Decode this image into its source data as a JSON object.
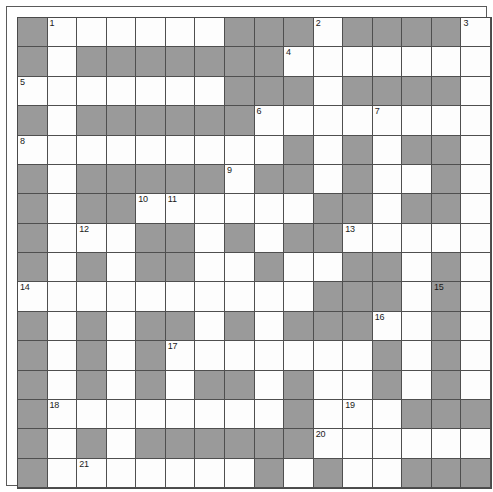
{
  "puzzle": {
    "title": "Crossword Grid",
    "type": "crossword",
    "rows": 16,
    "cols": 16,
    "colors": {
      "block": "#9a9a9a",
      "open": "#fdfdfd",
      "gridline": "#4f4f4f",
      "frame": "#5a5a5a",
      "number_text": "#1a1a1a"
    },
    "legend": {
      "open_label": "open-cell",
      "block_label": "blocked-cell"
    },
    "clue_numbers_visible": [
      1,
      2,
      3,
      4,
      5,
      6,
      7,
      8,
      9,
      10,
      11,
      12,
      13,
      14,
      15,
      16,
      17,
      18,
      19,
      20,
      21,
      22,
      23
    ],
    "numbers": {
      "1": {
        "row": 0,
        "col": 1
      },
      "2": {
        "row": 0,
        "col": 10
      },
      "3": {
        "row": 0,
        "col": 15
      },
      "4": {
        "row": 1,
        "col": 9
      },
      "5": {
        "row": 2,
        "col": 0
      },
      "6": {
        "row": 3,
        "col": 8
      },
      "7": {
        "row": 3,
        "col": 12
      },
      "8": {
        "row": 4,
        "col": 0
      },
      "9": {
        "row": 5,
        "col": 7
      },
      "10": {
        "row": 6,
        "col": 4
      },
      "11": {
        "row": 6,
        "col": 5
      },
      "12": {
        "row": 7,
        "col": 2
      },
      "13": {
        "row": 7,
        "col": 11
      },
      "14": {
        "row": 9,
        "col": 0
      },
      "15": {
        "row": 9,
        "col": 14
      },
      "16": {
        "row": 10,
        "col": 12
      },
      "17": {
        "row": 11,
        "col": 5
      },
      "18": {
        "row": 13,
        "col": 1
      },
      "19": {
        "row": 13,
        "col": 11
      },
      "20": {
        "row": 14,
        "col": 10
      },
      "21": {
        "row": 15,
        "col": 2
      },
      "22": {
        "row": 17,
        "col": 1
      },
      "23": {
        "row": 19,
        "col": 6
      }
    },
    "grid": [
      "#......###.####.",
      "#.#######.......",
      ".......###.####.",
      "#.######....#...",
      "................",
      "#.#####.##.##.#.",
      "#.##......##.##.",
      "#.#.###.#.##.##.",
      "..#.##..#..##.#.",
      "..........###.#.",
      "#.#.##.#.###..#.",
      "#.#.#.......#.#.",
      "#.#.##.##.#.##..",
      "#.........#..###",
      "#.#.#####.......",
      "#.#.......#.#.##",
      "#.#.#.#.#.#.#.#.",
      "#.............#.",
      "###.####.#..#.##",
      "###.##........##",
      "###.#########.##"
    ],
    "grid_rows": [
      {
        "index": 0,
        "cells": [
          "block",
          "open",
          "open",
          "open",
          "open",
          "open",
          "open",
          "block",
          "block",
          "block",
          "open",
          "block",
          "block",
          "block",
          "block",
          "open"
        ]
      },
      {
        "index": 1,
        "cells": [
          "block",
          "open",
          "block",
          "block",
          "block",
          "block",
          "block",
          "block",
          "block",
          "open",
          "open",
          "open",
          "open",
          "open",
          "open",
          "open"
        ]
      },
      {
        "index": 2,
        "cells": [
          "open",
          "open",
          "open",
          "open",
          "open",
          "open",
          "open",
          "block",
          "block",
          "block",
          "open",
          "block",
          "block",
          "block",
          "block",
          "open"
        ]
      },
      {
        "index": 3,
        "cells": [
          "block",
          "open",
          "block",
          "block",
          "block",
          "block",
          "block",
          "block",
          "open",
          "open",
          "open",
          "open",
          "open",
          "open",
          "open",
          "open"
        ]
      },
      {
        "index": 4,
        "cells": [
          "open",
          "open",
          "open",
          "open",
          "open",
          "open",
          "open",
          "open",
          "open",
          "block",
          "open",
          "block",
          "open",
          "block",
          "block",
          "open"
        ]
      },
      {
        "index": 5,
        "cells": [
          "block",
          "open",
          "block",
          "block",
          "block",
          "block",
          "block",
          "open",
          "block",
          "block",
          "open",
          "block",
          "open",
          "open",
          "block",
          "open"
        ]
      },
      {
        "index": 6,
        "cells": [
          "block",
          "open",
          "block",
          "block",
          "open",
          "open",
          "open",
          "open",
          "open",
          "open",
          "block",
          "block",
          "open",
          "block",
          "block",
          "open"
        ]
      },
      {
        "index": 7,
        "cells": [
          "block",
          "open",
          "open",
          "open",
          "block",
          "block",
          "open",
          "block",
          "open",
          "block",
          "block",
          "open",
          "open",
          "open",
          "open",
          "open"
        ]
      },
      {
        "index": 8,
        "cells": [
          "block",
          "open",
          "block",
          "open",
          "block",
          "block",
          "open",
          "open",
          "block",
          "open",
          "open",
          "block",
          "block",
          "open",
          "block",
          "open"
        ]
      },
      {
        "index": 9,
        "cells": [
          "open",
          "open",
          "open",
          "open",
          "open",
          "open",
          "open",
          "open",
          "open",
          "open",
          "block",
          "block",
          "block",
          "open",
          "block",
          "open"
        ]
      },
      {
        "index": 10,
        "cells": [
          "block",
          "open",
          "block",
          "open",
          "block",
          "block",
          "open",
          "block",
          "open",
          "block",
          "block",
          "block",
          "open",
          "open",
          "block",
          "open"
        ]
      },
      {
        "index": 11,
        "cells": [
          "block",
          "open",
          "block",
          "open",
          "block",
          "open",
          "open",
          "open",
          "open",
          "open",
          "open",
          "open",
          "block",
          "open",
          "block",
          "open"
        ]
      },
      {
        "index": 12,
        "cells": [
          "block",
          "open",
          "block",
          "open",
          "block",
          "open",
          "block",
          "block",
          "open",
          "block",
          "open",
          "open",
          "block",
          "open",
          "block",
          "open"
        ]
      },
      {
        "index": 13,
        "cells": [
          "block",
          "open",
          "open",
          "open",
          "open",
          "open",
          "open",
          "open",
          "open",
          "block",
          "open",
          "open",
          "open",
          "block",
          "block",
          "block"
        ]
      },
      {
        "index": 14,
        "cells": [
          "block",
          "open",
          "block",
          "open",
          "block",
          "block",
          "block",
          "block",
          "block",
          "block",
          "open",
          "open",
          "open",
          "open",
          "open",
          "open"
        ]
      },
      {
        "index": 15,
        "cells": [
          "block",
          "open",
          "open",
          "open",
          "open",
          "open",
          "open",
          "open",
          "block",
          "open",
          "block",
          "open",
          "open",
          "block",
          "block",
          "block"
        ]
      },
      {
        "index": 16,
        "cells": [
          "block",
          "open",
          "block",
          "open",
          "block",
          "block",
          "block",
          "block",
          "block",
          "open",
          "block",
          "open",
          "block",
          "block",
          "block",
          "block"
        ]
      },
      {
        "index": 17,
        "cells": [
          "block",
          "open",
          "open",
          "open",
          "open",
          "open",
          "open",
          "open",
          "open",
          "open",
          "open",
          "open",
          "open",
          "open",
          "block",
          "open"
        ]
      },
      {
        "index": 18,
        "cells": [
          "block",
          "block",
          "block",
          "open",
          "block",
          "block",
          "block",
          "block",
          "open",
          "block",
          "open",
          "open",
          "block",
          "open",
          "block",
          "block"
        ]
      },
      {
        "index": 19,
        "cells": [
          "block",
          "block",
          "block",
          "open",
          "block",
          "block",
          "open",
          "open",
          "open",
          "open",
          "open",
          "open",
          "open",
          "open",
          "block",
          "block"
        ]
      },
      {
        "index": 20,
        "cells": [
          "block",
          "block",
          "block",
          "open",
          "block",
          "block",
          "block",
          "block",
          "block",
          "block",
          "block",
          "block",
          "block",
          "open",
          "block",
          "block"
        ]
      }
    ]
  }
}
